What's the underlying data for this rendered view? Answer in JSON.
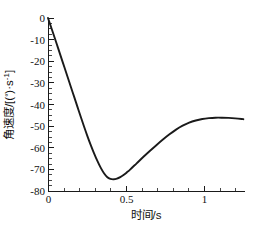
{
  "chart_data": {
    "type": "line",
    "title": "",
    "xlabel": "时间/s",
    "ylabel": "角速度/[(°)·s⁻¹]",
    "ylabel_parts": {
      "main": "角速度/[(",
      "degree": "°",
      "mid": ")·s",
      "exponent": "-1",
      "tail": "]"
    },
    "xlim": [
      0,
      1.2
    ],
    "ylim": [
      -80,
      0
    ],
    "grid": false,
    "legend": null,
    "x_ticks": [
      0,
      0.5,
      1
    ],
    "x_tick_labels": [
      "0",
      "0.5",
      "1"
    ],
    "x_minor_tick_step": 0.1,
    "y_ticks": [
      0,
      -10,
      -20,
      -30,
      -40,
      -50,
      -60,
      -70,
      -80
    ],
    "y_tick_labels": [
      "0",
      "-10",
      "-20",
      "-30",
      "-40",
      "-50",
      "-60",
      "-70",
      "-80"
    ],
    "y_minor_tick_step": 2.5,
    "line_color": "#1a1a1a",
    "background_color": "#ffffff",
    "series": [
      {
        "name": "角速度",
        "x": [
          0.0,
          0.02,
          0.04,
          0.06,
          0.08,
          0.1,
          0.12,
          0.14,
          0.16,
          0.18,
          0.2,
          0.22,
          0.24,
          0.26,
          0.28,
          0.3,
          0.32,
          0.34,
          0.36,
          0.38,
          0.4,
          0.42,
          0.44,
          0.46,
          0.48,
          0.5,
          0.54,
          0.58,
          0.62,
          0.66,
          0.7,
          0.74,
          0.78,
          0.82,
          0.86,
          0.9,
          0.94,
          0.98,
          1.02,
          1.06,
          1.1,
          1.14,
          1.18,
          1.19
        ],
        "y": [
          0.0,
          -4.5,
          -9.0,
          -13.6,
          -18.2,
          -22.8,
          -27.4,
          -32.0,
          -36.6,
          -41.2,
          -45.8,
          -50.3,
          -54.6,
          -58.7,
          -62.5,
          -66.0,
          -69.1,
          -71.7,
          -73.5,
          -74.4,
          -74.6,
          -74.3,
          -73.6,
          -72.6,
          -71.4,
          -70.1,
          -67.2,
          -64.3,
          -61.5,
          -58.8,
          -56.2,
          -53.8,
          -51.6,
          -49.8,
          -48.4,
          -47.4,
          -46.7,
          -46.3,
          -46.1,
          -46.1,
          -46.2,
          -46.4,
          -46.7,
          -46.8
        ],
        "min_value": -74.6,
        "min_at_x": 0.4,
        "max_after_min": -46.1,
        "max_after_min_at_x": 1.04,
        "end_value": -46.8
      }
    ]
  },
  "axes_geometry": {
    "left_px": 48,
    "right_px": 245,
    "top_px": 18,
    "bottom_px": 191
  }
}
